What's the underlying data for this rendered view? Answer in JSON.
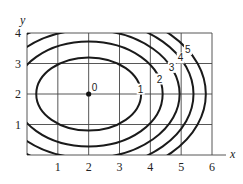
{
  "chart_data": {
    "type": "contour",
    "title": "",
    "xlabel": "x",
    "ylabel": "y",
    "xlim": [
      0,
      6
    ],
    "ylim": [
      0,
      4
    ],
    "x_ticks": [
      "1",
      "2",
      "3",
      "4",
      "5",
      "6"
    ],
    "y_ticks": [
      "1",
      "2",
      "3",
      "4"
    ],
    "grid": true,
    "center": {
      "x": 2,
      "y": 2,
      "label": "0"
    },
    "contours": [
      {
        "level": "1",
        "semi_axis_x": 1.7,
        "semi_axis_y": 1.2
      },
      {
        "level": "2",
        "semi_axis_x": 2.4,
        "semi_axis_y": 1.72
      },
      {
        "level": "3",
        "semi_axis_x": 2.95,
        "semi_axis_y": 2.1
      },
      {
        "level": "4",
        "semi_axis_x": 3.4,
        "semi_axis_y": 2.43
      },
      {
        "level": "5",
        "semi_axis_x": 3.8,
        "semi_axis_y": 2.72
      }
    ],
    "colors": {
      "line": "#1a1a1a",
      "grid": "#444444"
    }
  }
}
